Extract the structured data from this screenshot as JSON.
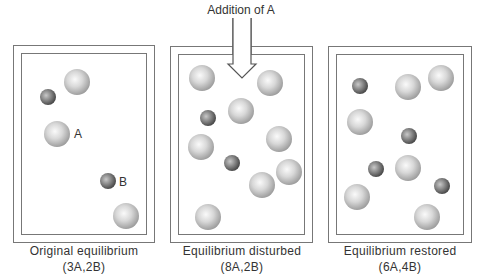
{
  "arrow": {
    "label": "Addition of A"
  },
  "panels": [
    {
      "caption": "Original equilibrium",
      "counts": "(3A,2B)",
      "sphere_labels": {
        "A": "A",
        "B": "B"
      }
    },
    {
      "caption": "Equilibrium disturbed",
      "counts": "(8A,2B)"
    },
    {
      "caption": "Equilibrium restored",
      "counts": "(6A,4B)"
    }
  ]
}
